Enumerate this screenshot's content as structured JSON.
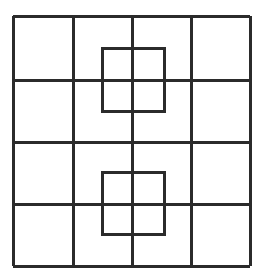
{
  "figure": {
    "background_color": "#ffffff",
    "line_color": "#2b2b2b",
    "canvas": {
      "width": 263,
      "height": 280
    }
  },
  "grid": {
    "name": "outer-grid",
    "rows": 4,
    "columns": 4,
    "stroke_width": 3,
    "bounds": {
      "left": 13,
      "top": 16,
      "right": 250,
      "bottom": 266
    },
    "vertical_line_x": [
      13,
      73,
      132,
      191,
      250
    ],
    "horizontal_line_y": [
      16,
      80,
      142,
      204,
      266
    ]
  },
  "inner_squares": [
    {
      "name": "upper-inner-square",
      "label": "Upper overlapping square",
      "x": 102,
      "y": 48,
      "width": 62,
      "height": 63,
      "stroke_width": 3,
      "center": [
        133,
        79.5
      ]
    },
    {
      "name": "lower-inner-square",
      "label": "Lower overlapping square",
      "x": 102,
      "y": 172,
      "width": 62,
      "height": 62,
      "stroke_width": 3,
      "center": [
        133,
        203
      ]
    }
  ]
}
